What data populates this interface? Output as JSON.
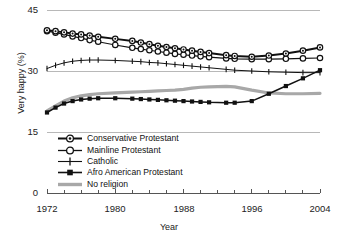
{
  "chart_data": {
    "type": "line",
    "title": "",
    "xlabel": "Year",
    "ylabel": "Very happy (%)",
    "xlim": [
      1972,
      2004
    ],
    "ylim": [
      0,
      45
    ],
    "yticks": [
      0,
      15,
      30,
      45
    ],
    "xticks": [
      1972,
      1980,
      1988,
      1996,
      2004
    ],
    "xminor_step": 2,
    "grid": true,
    "legend_position": "inside-bottom-left",
    "x": [
      1972,
      1973,
      1974,
      1975,
      1976,
      1977,
      1978,
      1980,
      1982,
      1983,
      1984,
      1985,
      1986,
      1987,
      1988,
      1989,
      1990,
      1991,
      1993,
      1994,
      1996,
      1998,
      2000,
      2002,
      2004
    ],
    "series": [
      {
        "name": "Conservative Protestant",
        "marker": "circle-dot",
        "color": "#111111",
        "values": [
          40.0,
          39.8,
          39.5,
          39.2,
          39.0,
          38.7,
          38.4,
          37.9,
          37.4,
          37.0,
          36.6,
          36.2,
          35.9,
          35.6,
          35.3,
          35.0,
          34.7,
          34.4,
          33.9,
          33.7,
          33.5,
          33.8,
          34.3,
          35.0,
          35.8
        ]
      },
      {
        "name": "Mainline Protestant",
        "marker": "circle-open",
        "color": "#111111",
        "values": [
          39.8,
          39.4,
          39.0,
          38.5,
          38.1,
          37.6,
          37.2,
          36.4,
          35.7,
          35.4,
          35.1,
          34.8,
          34.5,
          34.2,
          34.0,
          33.8,
          33.6,
          33.4,
          33.1,
          33.0,
          32.9,
          32.9,
          33.0,
          33.1,
          33.2
        ]
      },
      {
        "name": "Catholic",
        "marker": "plus",
        "color": "#111111",
        "values": [
          30.6,
          31.4,
          32.0,
          32.4,
          32.6,
          32.7,
          32.7,
          32.6,
          32.4,
          32.3,
          32.1,
          32.0,
          31.8,
          31.6,
          31.4,
          31.2,
          31.0,
          30.8,
          30.4,
          30.2,
          30.0,
          29.8,
          29.7,
          29.6,
          29.6
        ]
      },
      {
        "name": "Afro American Protestant",
        "marker": "square-filled",
        "color": "#111111",
        "values": [
          19.8,
          21.0,
          22.0,
          22.6,
          23.0,
          23.2,
          23.3,
          23.3,
          23.2,
          23.1,
          23.0,
          22.9,
          22.8,
          22.7,
          22.6,
          22.5,
          22.4,
          22.3,
          22.2,
          22.2,
          22.6,
          24.4,
          26.3,
          28.2,
          30.2
        ]
      },
      {
        "name": "No religion",
        "marker": "none",
        "color": "#a8a8a8",
        "values": [
          20.2,
          21.4,
          22.6,
          23.4,
          23.9,
          24.2,
          24.4,
          24.6,
          24.8,
          24.9,
          25.0,
          25.1,
          25.2,
          25.3,
          25.5,
          25.8,
          26.0,
          26.1,
          26.2,
          26.1,
          25.3,
          24.6,
          24.4,
          24.4,
          24.5
        ]
      }
    ]
  },
  "legend": {
    "items": [
      {
        "label": "Conservative Protestant",
        "marker": "circle-dot"
      },
      {
        "label": "Mainline Protestant",
        "marker": "circle-open"
      },
      {
        "label": "Catholic",
        "marker": "plus"
      },
      {
        "label": "Afro American Protestant",
        "marker": "square-filled"
      },
      {
        "label": "No religion",
        "marker": "thick-gray-line"
      }
    ]
  },
  "axes": {
    "y_label": "Very happy (%)",
    "x_label": "Year",
    "y_tick_labels": [
      "45",
      "30",
      "15",
      "0"
    ],
    "x_tick_labels": [
      "1972",
      "1980",
      "1988",
      "1996",
      "2004"
    ]
  },
  "colors": {
    "line_dark": "#111111",
    "line_gray": "#a8a8a8",
    "grid": "#b8b8b8",
    "axis": "#555555",
    "text": "#1a1a1a"
  }
}
